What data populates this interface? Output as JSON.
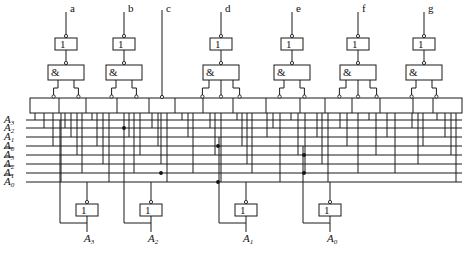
{
  "diagram": {
    "outputs": [
      "a",
      "b",
      "c",
      "d",
      "e",
      "f",
      "g"
    ],
    "gate_symbols": {
      "not": "1",
      "and": "&"
    },
    "row_labels": [
      {
        "name": "A",
        "sub": "3",
        "bar": false
      },
      {
        "name": "A",
        "sub": "2",
        "bar": false
      },
      {
        "name": "A",
        "sub": "1",
        "bar": false
      },
      {
        "name": "A",
        "sub": "0",
        "bar": false
      },
      {
        "name": "A",
        "sub": "3",
        "bar": true
      },
      {
        "name": "A",
        "sub": "2",
        "bar": true
      },
      {
        "name": "A",
        "sub": "1",
        "bar": true
      },
      {
        "name": "A",
        "sub": "0",
        "bar": true
      }
    ],
    "inputs": [
      {
        "name": "A",
        "sub": "3"
      },
      {
        "name": "A",
        "sub": "2"
      },
      {
        "name": "A",
        "sub": "1"
      },
      {
        "name": "A",
        "sub": "0"
      }
    ]
  }
}
